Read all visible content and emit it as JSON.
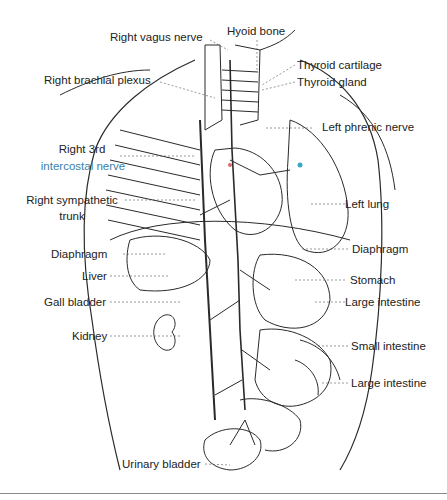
{
  "figure": {
    "type": "anatomical-illustration",
    "line_color": "#2a2a2a",
    "accent_colors": {
      "highlight_blue": "#3aa7c9",
      "highlight_red": "#d46a6a",
      "bottom_rule": "#8a8a8a"
    }
  },
  "labels": {
    "right_vagus_nerve": "Right vagus nerve",
    "hyoid_bone": "Hyoid bone",
    "thyroid_cartilage": "Thyroid cartilage",
    "thyroid_gland": "Thyroid gland",
    "right_brachial_plexus": "Right brachial plexus",
    "left_phrenic_nerve": "Left phrenic nerve",
    "right_3rd_line1": "Right 3rd",
    "right_3rd_line2": "intercostal nerve",
    "right_sympathetic_line1": "Right sympathetic",
    "right_sympathetic_line2": "trunk",
    "left_lung": "Left lung",
    "diaphragm_left_side": "Diaphragm",
    "diaphragm_right_side": "Diaphragm",
    "liver": "Liver",
    "stomach": "Stomach",
    "gall_bladder": "Gall bladder",
    "large_intestine_upper": "Large intestine",
    "kidney": "Kidney",
    "small_intestine": "Small intestine",
    "large_intestine_lower": "Large intestine",
    "urinary_bladder": "Urinary bladder"
  }
}
